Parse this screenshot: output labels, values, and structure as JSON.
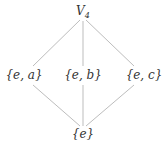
{
  "diagram": {
    "edge_color": "#bdbdbd",
    "nodes": [
      {
        "id": "top",
        "label": "V",
        "sub": "4",
        "x": 83,
        "y": 12
      },
      {
        "id": "ea",
        "label": "{e, a}",
        "x": 24,
        "y": 75
      },
      {
        "id": "eb",
        "label": "{e, b}",
        "x": 83,
        "y": 75
      },
      {
        "id": "ec",
        "label": "{e, c}",
        "x": 144,
        "y": 75
      },
      {
        "id": "bottom",
        "label": "{e}",
        "x": 83,
        "y": 134
      }
    ],
    "edges": [
      {
        "from": "top",
        "to": "ea"
      },
      {
        "from": "top",
        "to": "eb"
      },
      {
        "from": "top",
        "to": "ec"
      },
      {
        "from": "ea",
        "to": "bottom"
      },
      {
        "from": "eb",
        "to": "bottom"
      },
      {
        "from": "ec",
        "to": "bottom"
      }
    ]
  }
}
